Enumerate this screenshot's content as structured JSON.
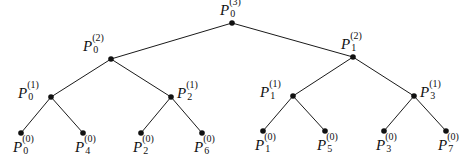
{
  "diagram": {
    "title": "",
    "width": 475,
    "height": 167,
    "colors": {
      "edge": "#1a1a1a",
      "node": "#111111",
      "background": "#ffffff"
    },
    "nodes": [
      {
        "id": "n3_0",
        "base": "P",
        "sup": "(3)",
        "sub": "0",
        "x": 232,
        "y": 23,
        "label_pos": "above"
      },
      {
        "id": "n2_0",
        "base": "P",
        "sup": "(2)",
        "sub": "0",
        "x": 111,
        "y": 59,
        "label_pos": "above-left"
      },
      {
        "id": "n2_1",
        "base": "P",
        "sup": "(2)",
        "sub": "1",
        "x": 353,
        "y": 57,
        "label_pos": "above"
      },
      {
        "id": "n1_0",
        "base": "P",
        "sup": "(1)",
        "sub": "0",
        "x": 51,
        "y": 97,
        "label_pos": "left"
      },
      {
        "id": "n1_2",
        "base": "P",
        "sup": "(1)",
        "sub": "2",
        "x": 171,
        "y": 97,
        "label_pos": "right"
      },
      {
        "id": "n1_1",
        "base": "P",
        "sup": "(1)",
        "sub": "1",
        "x": 293,
        "y": 96,
        "label_pos": "left"
      },
      {
        "id": "n1_3",
        "base": "P",
        "sup": "(1)",
        "sub": "3",
        "x": 414,
        "y": 96,
        "label_pos": "right"
      },
      {
        "id": "n0_0",
        "base": "P",
        "sup": "(0)",
        "sub": "0",
        "x": 21,
        "y": 133,
        "label_pos": "below"
      },
      {
        "id": "n0_4",
        "base": "P",
        "sup": "(0)",
        "sub": "4",
        "x": 83,
        "y": 133,
        "label_pos": "below"
      },
      {
        "id": "n0_2",
        "base": "P",
        "sup": "(0)",
        "sub": "2",
        "x": 141,
        "y": 133,
        "label_pos": "below"
      },
      {
        "id": "n0_6",
        "base": "P",
        "sup": "(0)",
        "sub": "6",
        "x": 202,
        "y": 133,
        "label_pos": "below"
      },
      {
        "id": "n0_1",
        "base": "P",
        "sup": "(0)",
        "sub": "1",
        "x": 263,
        "y": 131,
        "label_pos": "below"
      },
      {
        "id": "n0_5",
        "base": "P",
        "sup": "(0)",
        "sub": "5",
        "x": 325,
        "y": 131,
        "label_pos": "below"
      },
      {
        "id": "n0_3",
        "base": "P",
        "sup": "(0)",
        "sub": "3",
        "x": 384,
        "y": 131,
        "label_pos": "below"
      },
      {
        "id": "n0_7",
        "base": "P",
        "sup": "(0)",
        "sub": "7",
        "x": 446,
        "y": 131,
        "label_pos": "below"
      }
    ],
    "edges": [
      [
        "n3_0",
        "n2_0"
      ],
      [
        "n3_0",
        "n2_1"
      ],
      [
        "n2_0",
        "n1_0"
      ],
      [
        "n2_0",
        "n1_2"
      ],
      [
        "n2_1",
        "n1_1"
      ],
      [
        "n2_1",
        "n1_3"
      ],
      [
        "n1_0",
        "n0_0"
      ],
      [
        "n1_0",
        "n0_4"
      ],
      [
        "n1_2",
        "n0_2"
      ],
      [
        "n1_2",
        "n0_6"
      ],
      [
        "n1_1",
        "n0_1"
      ],
      [
        "n1_1",
        "n0_5"
      ],
      [
        "n1_3",
        "n0_3"
      ],
      [
        "n1_3",
        "n0_7"
      ]
    ]
  }
}
